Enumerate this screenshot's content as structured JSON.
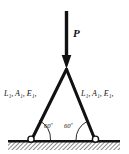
{
  "figure": {
    "background_color": "#ffffff",
    "ink_color": "#111111"
  },
  "load": {
    "label": "P",
    "direction": "down",
    "arrow_name": "load-arrow"
  },
  "members": {
    "left": {
      "label": "L₁, A₁, E₁,"
    },
    "right": {
      "label": "L₁, A₁, E₁,"
    }
  },
  "angles": {
    "left": "60º",
    "right": "60º"
  },
  "supports": {
    "left": "pin-support",
    "right": "pin-support"
  },
  "ground": {
    "label": "hatched-ground"
  }
}
